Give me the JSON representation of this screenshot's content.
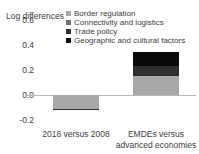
{
  "chart_data": {
    "type": "bar",
    "stacked": true,
    "title": "",
    "subtitle": "",
    "xlabel": "",
    "ylabel": "Log differences",
    "ylim": [
      -0.2,
      0.6
    ],
    "yticks": [
      0.6,
      0.4,
      0.2,
      0.0,
      -0.2
    ],
    "ytick_labels": [
      "0.6",
      "0.4",
      "0.2",
      "0.0",
      "-0.2"
    ],
    "grid": false,
    "legend_position": "top-right",
    "categories": [
      "2018 versus 2008",
      "EMDEs versus advanced economies"
    ],
    "category_label_lines": [
      [
        "2018 versus 2008"
      ],
      [
        "EMDEs versus",
        "advanced economies"
      ]
    ],
    "series": [
      {
        "name": "Border regulation",
        "color": "#a8a8a8",
        "values": [
          -0.112,
          0.155
        ]
      },
      {
        "name": "Connectivity and logistics",
        "color": "#6e6e6e",
        "values": [
          0.0,
          0.0
        ]
      },
      {
        "name": "Trade policy",
        "color": "#303030",
        "values": [
          -0.008,
          0.075
        ]
      },
      {
        "name": "Geographic and cultural factors",
        "color": "#0a0a0a",
        "values": [
          0.0,
          0.115
        ]
      }
    ],
    "totals": [
      -0.12,
      0.345
    ],
    "legend_entries": [
      "Border regulation",
      "Connectivity and logistics",
      "Trade policy",
      "Geographic and cultural factors"
    ],
    "colors": {
      "border_regulation": "#a8a8a8",
      "connectivity_and_logistics": "#6e6e6e",
      "trade_policy": "#303030",
      "geographic_and_cultural_factors": "#0a0a0a",
      "axis_line": "#b9b9b9",
      "text": "#3d3d3d",
      "background": "#ffffff"
    }
  }
}
